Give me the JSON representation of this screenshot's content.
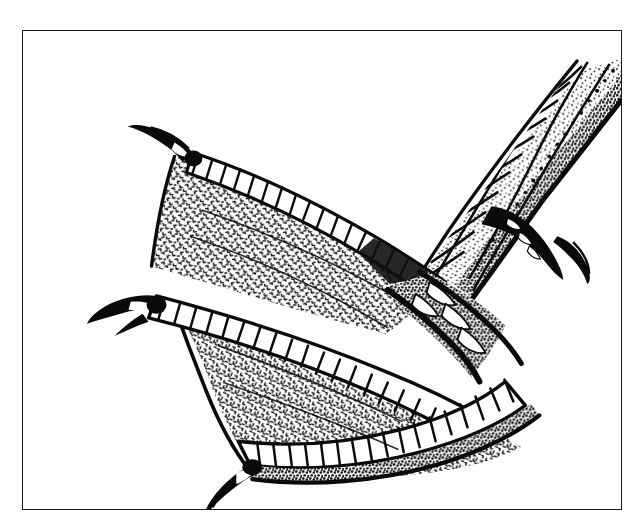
{
  "figure": {
    "caption": "",
    "title": "",
    "background_color": "#ffffff",
    "ink_color": "#000000",
    "frame_color": "#1a1a1a",
    "frame": {
      "x": 22,
      "y": 30,
      "width": 600,
      "height": 480,
      "stroke_width": 1.6
    }
  },
  "illustration": {
    "subject": "webbed-bird-foot",
    "style": "pen-and-ink line drawing",
    "description": "Palmate webbed foot of a waterbird seen from above, three forward toes spread with skin webbing stretched between them, attached to a scaled tarsus that exits the frame at upper right, with a small hind toe and claw",
    "parts": [
      {
        "name": "tarsus",
        "label": "scaled lower leg",
        "fill": "stippled large reticulate scales"
      },
      {
        "name": "hind-toe",
        "label": "hallux with claw",
        "fill": "solid black claw"
      },
      {
        "name": "inner-toe",
        "label": "upper forward toe",
        "fill": "transverse ladder scutes"
      },
      {
        "name": "middle-toe",
        "label": "middle forward toe",
        "fill": "transverse ladder scutes"
      },
      {
        "name": "outer-toe",
        "label": "lower forward toe",
        "fill": "transverse ladder scutes"
      },
      {
        "name": "upper-web",
        "label": "web between inner and middle toes",
        "fill": "fine squiggle stipple"
      },
      {
        "name": "lower-web",
        "label": "web between middle and outer toes",
        "fill": "fine squiggle stipple"
      },
      {
        "name": "claw-inner",
        "label": "inner toe claw",
        "fill": "solid black"
      },
      {
        "name": "claw-middle",
        "label": "middle toe claw",
        "fill": "solid black"
      },
      {
        "name": "claw-outer",
        "label": "outer toe claw",
        "fill": "solid black"
      }
    ]
  }
}
